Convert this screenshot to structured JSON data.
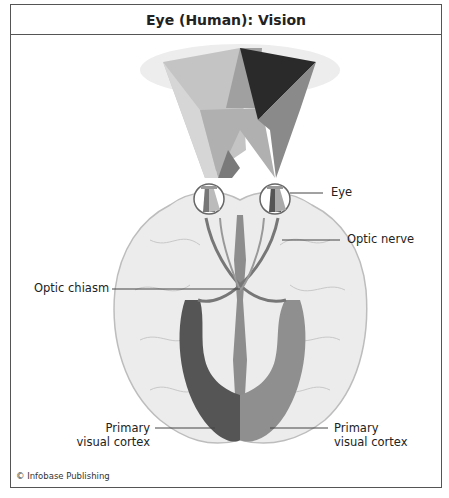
{
  "figure": {
    "title": "Eye (Human): Vision",
    "credit": "© Infobase Publishing",
    "labels": {
      "eye": "Eye",
      "optic_nerve": "Optic nerve",
      "optic_chiasm": "Optic chiasm",
      "primary_visual_cortex_left_line1": "Primary",
      "primary_visual_cortex_left_line2": "visual cortex",
      "primary_visual_cortex_right_line1": "Primary",
      "primary_visual_cortex_right_line2": "visual cortex"
    },
    "colors": {
      "border": "#555555",
      "brain_fill": "#ececec",
      "brain_outline": "#bdbdbd",
      "dark_field": "#2a2a2a",
      "mid_field": "#8a8a8a",
      "light_field": "#bcbcbc",
      "left_cortex": "#555555",
      "right_cortex": "#8f8f8f"
    }
  }
}
